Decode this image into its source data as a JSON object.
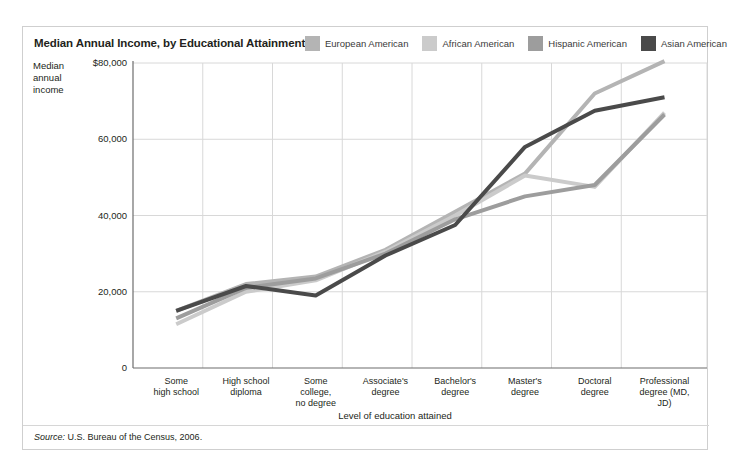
{
  "chart_title": "Median Annual Income, by Educational Attainment",
  "source_note": {
    "label": "Source:",
    "text": "U.S. Bureau of the Census, 2006."
  },
  "legend": {
    "position": "top-right",
    "items": [
      {
        "label": "European American",
        "color": "#b4b4b4"
      },
      {
        "label": "African American",
        "color": "#cbcbcb"
      },
      {
        "label": "Hispanic American",
        "color": "#9d9d9d"
      },
      {
        "label": "Asian American",
        "color": "#4a4a4a"
      }
    ]
  },
  "chart_data": {
    "type": "line",
    "title": "Median Annual Income, by Educational Attainment",
    "xlabel": "Level of education attained",
    "ylabel": "Median annual income",
    "ylim": [
      0,
      80000
    ],
    "yticks": [
      0,
      20000,
      40000,
      60000,
      80000
    ],
    "ytick_labels": [
      "0",
      "20,000",
      "40,000",
      "60,000",
      "80,000"
    ],
    "grid": true,
    "categories": [
      "Some high school",
      "High school diploma",
      "Some college, no degree",
      "Associate's degree",
      "Bachelor's degree",
      "Master's degree",
      "Doctoral degree",
      "Professional degree (MD, JD)"
    ],
    "series": [
      {
        "name": "European American",
        "color": "#b4b4b4",
        "values": [
          15000,
          22000,
          24000,
          31000,
          41000,
          51000,
          72000,
          80500
        ]
      },
      {
        "name": "African American",
        "color": "#cbcbcb",
        "values": [
          11500,
          20000,
          23000,
          30500,
          40000,
          50500,
          47500,
          67000
        ]
      },
      {
        "name": "Hispanic American",
        "color": "#9d9d9d",
        "values": [
          13000,
          21000,
          23500,
          30000,
          39000,
          45000,
          48000,
          66500
        ]
      },
      {
        "name": "Asian American",
        "color": "#4a4a4a",
        "values": [
          15000,
          21500,
          19000,
          29500,
          37500,
          58000,
          67500,
          71000
        ]
      }
    ]
  },
  "xtick_labels": [
    [
      "Some",
      "high school"
    ],
    [
      "High school",
      "diploma"
    ],
    [
      "Some",
      "college,",
      "no degree"
    ],
    [
      "Associate's",
      "degree"
    ],
    [
      "Bachelor's",
      "degree"
    ],
    [
      "Master's",
      "degree"
    ],
    [
      "Doctoral",
      "degree"
    ],
    [
      "Professional",
      "degree (MD,",
      "JD)"
    ]
  ],
  "y_axis_title_lines": [
    "Median",
    "annual",
    "income"
  ]
}
